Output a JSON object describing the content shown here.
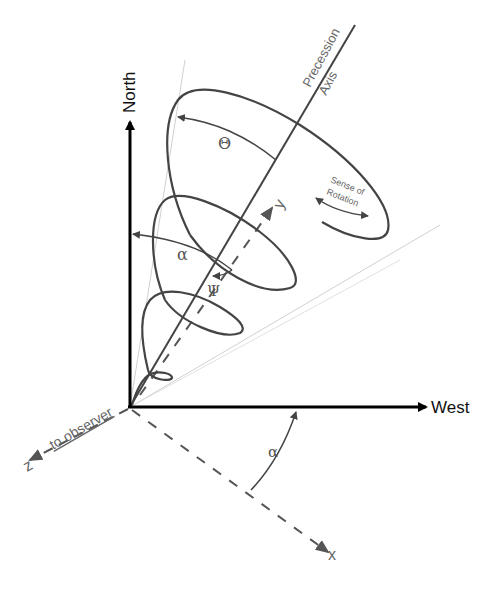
{
  "diagram": {
    "axes": {
      "north": "North",
      "west": "West",
      "z_axis": "z",
      "z_caption": "to observer",
      "x_axis": "x",
      "y_axis": "y",
      "precession_axis_line1": "Precession",
      "precession_axis_line2": "Axis"
    },
    "angles": {
      "theta": "Θ",
      "alpha_upper": "α",
      "alpha_lower": "α",
      "psi": "Ψ"
    },
    "annotations": {
      "sense_line1": "Sense of",
      "sense_line2": "Rotation"
    },
    "colors": {
      "axis": "#000000",
      "curve": "#444444",
      "cone": "#cccccc",
      "dashed": "#555555"
    }
  }
}
